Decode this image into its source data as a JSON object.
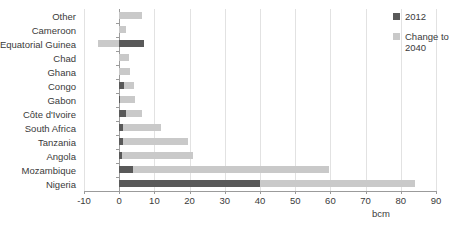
{
  "chart_data": {
    "type": "bar",
    "orientation": "horizontal",
    "stacked": true,
    "title": "",
    "xlabel": "bcm",
    "ylabel": "",
    "xlim": [
      -10,
      90
    ],
    "xticks": [
      -10,
      0,
      10,
      20,
      30,
      40,
      50,
      60,
      70,
      80,
      90
    ],
    "grid": true,
    "grid_axis": "x",
    "legend_position": "right",
    "categories": [
      "Other",
      "Cameroon",
      "Equatorial Guinea",
      "Chad",
      "Ghana",
      "Congo",
      "Gabon",
      "Côte d'Ivoire",
      "South Africa",
      "Tanzania",
      "Angola",
      "Mozambique",
      "Nigeria"
    ],
    "series": [
      {
        "name": "2012",
        "color": "#595959",
        "values": [
          0,
          0,
          7.0,
          0,
          0,
          1.5,
          0.2,
          2.0,
          1.2,
          1.0,
          0.8,
          4.0,
          40.0
        ]
      },
      {
        "name": "Change to 2040",
        "color": "#c9c9c9",
        "values": [
          6.5,
          1.8,
          -6.0,
          2.8,
          3.0,
          2.8,
          4.2,
          4.5,
          10.8,
          18.5,
          20.2,
          55.5,
          44.0
        ]
      }
    ]
  },
  "legend": {
    "items": [
      {
        "label": "2012",
        "color": "#595959"
      },
      {
        "label": "Change to 2040",
        "color": "#c9c9c9"
      }
    ]
  },
  "axis": {
    "unit": "bcm",
    "tick_labels": [
      "-10",
      "0",
      "10",
      "20",
      "30",
      "40",
      "50",
      "60",
      "70",
      "80",
      "90"
    ]
  }
}
